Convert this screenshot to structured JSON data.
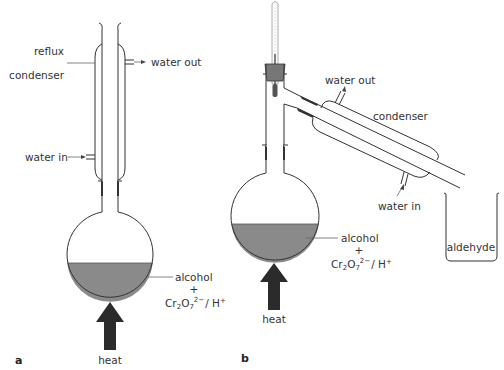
{
  "figure": {
    "panels": [
      {
        "id": "a",
        "panel_label": "a",
        "title": "Reflux apparatus",
        "labels": {
          "condenser": [
            "reflux",
            "condenser"
          ],
          "water_out": "water out",
          "water_in": "water in",
          "mixture_line1": "alcohol",
          "mixture_plus": "+",
          "mixture_line2_prefix": "Cr",
          "mixture_line2_sub1": "2",
          "mixture_line2_o": "O",
          "mixture_line2_sub2": "7",
          "mixture_line2_sup": "2−",
          "mixture_line2_suffix": "/ H",
          "mixture_line2_sup2": "+",
          "heat": "heat"
        }
      },
      {
        "id": "b",
        "panel_label": "b",
        "title": "Distillation apparatus",
        "labels": {
          "water_out": "water out",
          "condenser": "condenser",
          "water_in": "water in",
          "receiver": "aldehyde",
          "mixture_line1": "alcohol",
          "mixture_plus": "+",
          "mixture_line2_prefix": "Cr",
          "mixture_line2_sub1": "2",
          "mixture_line2_o": "O",
          "mixture_line2_sub2": "7",
          "mixture_line2_sup": "2−",
          "mixture_line2_suffix": "/ H",
          "mixture_line2_sup2": "+",
          "heat": "heat"
        }
      }
    ],
    "colors": {
      "glass_stroke": "#333333",
      "liquid_fill": "#8a8a8a",
      "heat_arrow": "#2b2b2b",
      "stopper": "#777777",
      "background": "#ffffff"
    }
  }
}
